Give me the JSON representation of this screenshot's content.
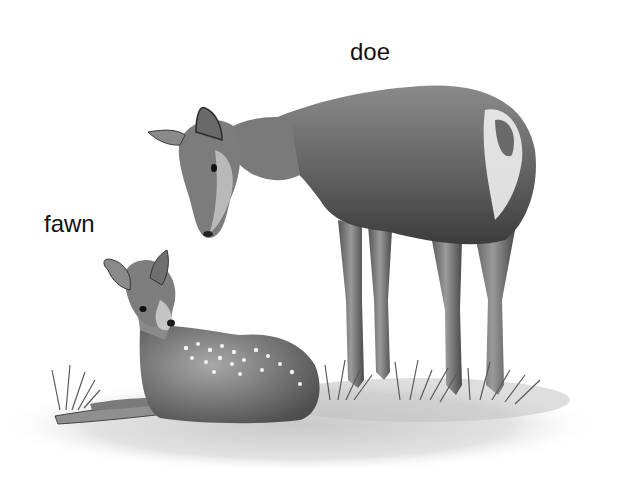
{
  "illustration": {
    "style": "grayscale pencil illustration",
    "labels": {
      "doe": "doe",
      "fawn": "fawn"
    },
    "subjects": [
      {
        "name": "doe",
        "pose": "standing, head lowered toward fawn"
      },
      {
        "name": "fawn",
        "pose": "lying on grass, spotted coat"
      }
    ],
    "colors": {
      "background": "#ffffff",
      "text": "#111111"
    }
  }
}
